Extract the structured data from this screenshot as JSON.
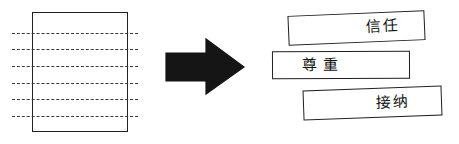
{
  "diagram": {
    "type": "process-flow",
    "source": {
      "name": "lined-document",
      "icon": "document-icon",
      "line_count": 6,
      "line_style": "dashed",
      "border_color": "#222222",
      "line_color": "#3a3a3a",
      "lines": [
        {
          "index": 1,
          "y": 33
        },
        {
          "index": 2,
          "y": 49
        },
        {
          "index": 3,
          "y": 66
        },
        {
          "index": 4,
          "y": 83
        },
        {
          "index": 5,
          "y": 99
        },
        {
          "index": 6,
          "y": 116
        }
      ]
    },
    "connector": {
      "name": "right-arrow",
      "icon": "arrow-right-icon",
      "direction": "right",
      "color": "#151515"
    },
    "outputs": {
      "color": "#1f1f1f",
      "items": [
        {
          "id": "trust",
          "label": "信任",
          "rotation": -2.4
        },
        {
          "id": "respect",
          "label": "尊重",
          "rotation": -0.3
        },
        {
          "id": "accept",
          "label": "接纳",
          "rotation": -2.0
        }
      ]
    }
  },
  "colors": {
    "background": "#ffffff",
    "ink": "#141414",
    "arrow": "#151515"
  }
}
